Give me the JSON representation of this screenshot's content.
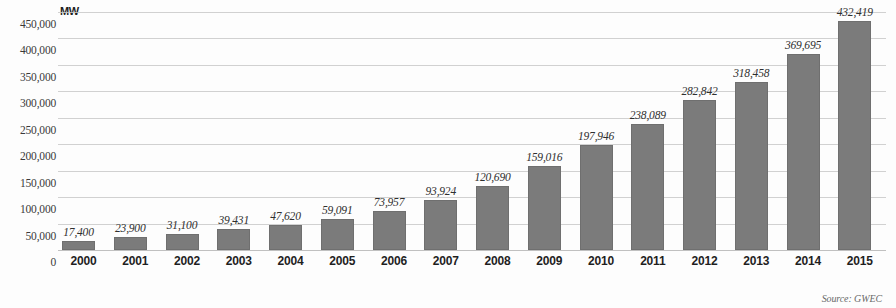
{
  "unit_label": "MW",
  "source_note": "Source: GWEC",
  "chart_data": {
    "type": "bar",
    "title": "",
    "subtitle": "",
    "xlabel": "",
    "ylabel": "MW",
    "ylim": [
      0,
      450000
    ],
    "ytick_step": 50000,
    "ytick_labels": [
      "450,000",
      "400,000",
      "350,000",
      "300,000",
      "250,000",
      "200,000",
      "150,000",
      "100,000",
      "50,000",
      "0"
    ],
    "ytick_values": [
      450000,
      400000,
      350000,
      300000,
      250000,
      200000,
      150000,
      100000,
      50000,
      0
    ],
    "grid": true,
    "legend": "none",
    "bar_color": "#7b7b7b",
    "categories": [
      "2000",
      "2001",
      "2002",
      "2003",
      "2004",
      "2005",
      "2006",
      "2007",
      "2008",
      "2009",
      "2010",
      "2011",
      "2012",
      "2013",
      "2014",
      "2015"
    ],
    "values": [
      17400,
      23900,
      31100,
      39431,
      47620,
      59091,
      73957,
      93924,
      120690,
      159016,
      197946,
      238089,
      282842,
      318458,
      369695,
      432419
    ],
    "value_labels": [
      "17,400",
      "23,900",
      "31,100",
      "39,431",
      "47,620",
      "59,091",
      "73,957",
      "93,924",
      "120,690",
      "159,016",
      "197,946",
      "238,089",
      "282,842",
      "318,458",
      "369,695",
      "432,419"
    ]
  }
}
